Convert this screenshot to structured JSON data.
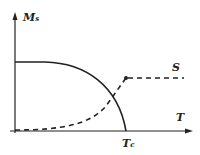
{
  "diagram": {
    "y_axis_label": "M",
    "y_axis_sub": "s",
    "x_axis_label": "T",
    "critical_label": "T",
    "critical_sub": "c",
    "curve_label": "S",
    "line_color": "#222222"
  }
}
